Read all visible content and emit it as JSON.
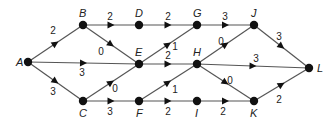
{
  "diagram": {
    "type": "directed-weighted-graph",
    "colors": {
      "edge": "#555555",
      "node": "#111111",
      "text": "#222222",
      "background": "#ffffff"
    },
    "nodes": [
      {
        "id": "A",
        "label": "A",
        "x": 28,
        "y": 62,
        "lx": -12,
        "ly": 4
      },
      {
        "id": "B",
        "label": "B",
        "x": 83,
        "y": 25,
        "lx": -4,
        "ly": -8
      },
      {
        "id": "C",
        "label": "C",
        "x": 83,
        "y": 101,
        "lx": -4,
        "ly": 16
      },
      {
        "id": "D",
        "label": "D",
        "x": 139,
        "y": 25,
        "lx": -4,
        "ly": -8
      },
      {
        "id": "E",
        "label": "E",
        "x": 139,
        "y": 64,
        "lx": -4,
        "ly": -8
      },
      {
        "id": "F",
        "label": "F",
        "x": 139,
        "y": 101,
        "lx": -3,
        "ly": 16
      },
      {
        "id": "G",
        "label": "G",
        "x": 197,
        "y": 25,
        "lx": -4,
        "ly": -8
      },
      {
        "id": "H",
        "label": "H",
        "x": 197,
        "y": 64,
        "lx": -4,
        "ly": -8
      },
      {
        "id": "I",
        "label": "I",
        "x": 197,
        "y": 101,
        "lx": -2,
        "ly": 16
      },
      {
        "id": "J",
        "label": "J",
        "x": 254,
        "y": 25,
        "lx": -3,
        "ly": -8
      },
      {
        "id": "K",
        "label": "K",
        "x": 254,
        "y": 101,
        "lx": -4,
        "ly": 16
      },
      {
        "id": "L",
        "label": "L",
        "x": 309,
        "y": 68,
        "lx": 8,
        "ly": 4
      }
    ],
    "edges": [
      {
        "from": "A",
        "to": "B",
        "weight": "2",
        "wx": 53,
        "wy": 34
      },
      {
        "from": "A",
        "to": "E",
        "weight": "3",
        "wx": 82,
        "wy": 76
      },
      {
        "from": "A",
        "to": "C",
        "weight": "3",
        "wx": 53,
        "wy": 95
      },
      {
        "from": "B",
        "to": "D",
        "weight": "2",
        "wx": 110,
        "wy": 20
      },
      {
        "from": "B",
        "to": "E",
        "weight": "0",
        "wx": 101,
        "wy": 55
      },
      {
        "from": "C",
        "to": "E",
        "weight": "0",
        "wx": 115,
        "wy": 92
      },
      {
        "from": "C",
        "to": "F",
        "weight": "3",
        "wx": 110,
        "wy": 115
      },
      {
        "from": "D",
        "to": "G",
        "weight": "2",
        "wx": 168,
        "wy": 20
      },
      {
        "from": "E",
        "to": "G",
        "weight": "1",
        "wx": 175,
        "wy": 50
      },
      {
        "from": "E",
        "to": "H",
        "weight": "2",
        "wx": 168,
        "wy": 59
      },
      {
        "from": "F",
        "to": "H",
        "weight": "1",
        "wx": 175,
        "wy": 93
      },
      {
        "from": "F",
        "to": "I",
        "weight": "2",
        "wx": 168,
        "wy": 115
      },
      {
        "from": "G",
        "to": "J",
        "weight": "3",
        "wx": 225,
        "wy": 20
      },
      {
        "from": "H",
        "to": "J",
        "weight": "0",
        "wx": 221,
        "wy": 45
      },
      {
        "from": "H",
        "to": "L",
        "weight": "3",
        "wx": 256,
        "wy": 62
      },
      {
        "from": "H",
        "to": "K",
        "weight": "0",
        "wx": 230,
        "wy": 84
      },
      {
        "from": "I",
        "to": "K",
        "weight": "2",
        "wx": 223,
        "wy": 115
      },
      {
        "from": "J",
        "to": "L",
        "weight": "3",
        "wx": 279,
        "wy": 40
      },
      {
        "from": "K",
        "to": "L",
        "weight": "2",
        "wx": 279,
        "wy": 103
      }
    ]
  }
}
